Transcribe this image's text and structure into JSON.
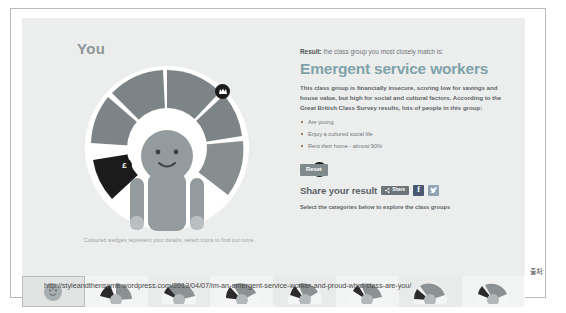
{
  "widget": {
    "you_title": "You",
    "caption": "Coloured wedges represent your details, select icons to find out more.",
    "markers": [
      {
        "name": "culture-icon",
        "glyph": "crown"
      },
      {
        "name": "money-icon",
        "glyph": "£"
      },
      {
        "name": "social-icon",
        "glyph": "people"
      }
    ]
  },
  "info": {
    "result_prefix": "Result:",
    "result_rest": " the class group you most closely match is:",
    "group_title": "Emergent service workers",
    "description": "This class group is financially insecure, scoring low for savings and house value, but high for social and cultural factors. According to the Great British Class Survey results, lots of people in this group:",
    "bullets": [
      "Are young",
      "Enjoy a cultured social life",
      "Rent their home - almost 90%"
    ],
    "reset_label": "Reset",
    "share_label": "Share your result",
    "share_button_label": "Share",
    "facebook_label": "f",
    "sub_note": "Select the categories below to explore the class groups"
  },
  "thumbnails": [
    {
      "name": "thumb-you",
      "selected": true
    },
    {
      "name": "thumb-class-1",
      "selected": false
    },
    {
      "name": "thumb-class-2",
      "selected": false
    },
    {
      "name": "thumb-class-3",
      "selected": false
    },
    {
      "name": "thumb-class-4",
      "selected": false
    },
    {
      "name": "thumb-class-5",
      "selected": false
    },
    {
      "name": "thumb-class-6",
      "selected": false
    },
    {
      "name": "thumb-class-7",
      "selected": false
    }
  ],
  "footer": {
    "source_label": "출처:",
    "url": "http://styleandthensome.wordpress.com/2013/04/07/im-an-emergent-service-worker-and-proud-what-class-are-you/"
  },
  "colors": {
    "group_title": "#7fa3a8",
    "wedge_mid": "#7d8487",
    "wedge_dark": "#1b1b1b",
    "facebook": "#4a5a72",
    "twitter": "#8fa4b4"
  }
}
